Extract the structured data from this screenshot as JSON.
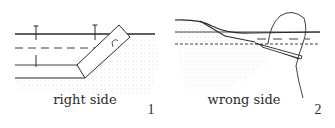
{
  "figure": {
    "panels": [
      {
        "id": 1,
        "caption": "right side",
        "number": "1"
      },
      {
        "id": 2,
        "caption": "wrong side",
        "number": "2"
      }
    ],
    "colors": {
      "ink": "#2a2a2a",
      "stipple": "#9a9a9a",
      "background": "#ffffff"
    }
  }
}
